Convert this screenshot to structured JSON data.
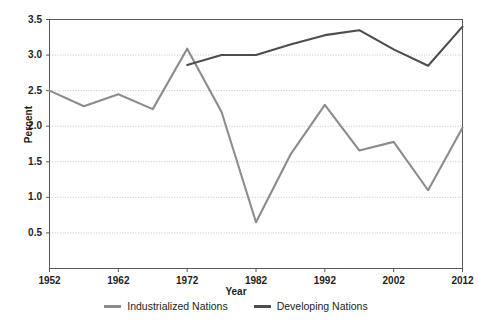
{
  "chart_data": {
    "type": "line",
    "title": "",
    "xlabel": "Year",
    "ylabel": "Percent",
    "xlim": [
      1952,
      2012
    ],
    "ylim": [
      0.0,
      3.5
    ],
    "xticks": [
      1952,
      1962,
      1972,
      1982,
      1992,
      2002,
      2012
    ],
    "yticks": [
      0.5,
      1.0,
      1.5,
      2.0,
      2.5,
      3.0,
      3.5
    ],
    "ytick_labels": [
      "0.5",
      "1.0",
      "1.5",
      "2.0",
      "2.5",
      "3.0",
      "3.5"
    ],
    "xtick_labels": [
      "1952",
      "1962",
      "1972",
      "1982",
      "1992",
      "2002",
      "2012"
    ],
    "grid": true,
    "grid_style": "dotted-horizontal",
    "legend_position": "bottom-center",
    "series": [
      {
        "name": "Industrialized Nations",
        "color": "#8c8c8c",
        "x": [
          1952,
          1957,
          1962,
          1967,
          1972,
          1977,
          1982,
          1987,
          1992,
          1997,
          2002,
          2007,
          2012
        ],
        "values": [
          2.5,
          2.28,
          2.45,
          2.24,
          3.09,
          2.2,
          0.65,
          1.6,
          2.3,
          1.66,
          1.78,
          1.1,
          1.98
        ]
      },
      {
        "name": "Developing Nations",
        "color": "#4d4d4d",
        "x": [
          1972,
          1977,
          1982,
          1987,
          1992,
          1997,
          2002,
          2007,
          2012
        ],
        "values": [
          2.86,
          3.0,
          3.0,
          3.15,
          3.28,
          3.35,
          3.08,
          2.85,
          3.4
        ]
      }
    ]
  },
  "axis": {
    "y_title": "Percent",
    "x_title": "Year"
  },
  "legend": {
    "items": [
      {
        "label": "Industrialized Nations",
        "swatch_name": "legend-swatch-industrialized",
        "color": "#8c8c8c"
      },
      {
        "label": "Developing Nations",
        "swatch_name": "legend-swatch-developing",
        "color": "#4d4d4d"
      }
    ]
  },
  "colors": {
    "industrialized": "#8c8c8c",
    "developing": "#4d4d4d",
    "axis": "#58595b",
    "grid": "#a7a9ac",
    "text": "#231f20",
    "background": "#ffffff"
  }
}
